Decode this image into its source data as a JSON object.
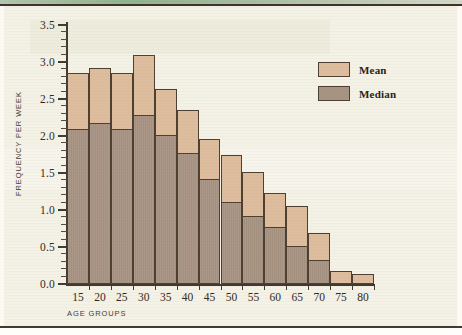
{
  "chart_data": {
    "type": "bar",
    "subtype": "overlaid-stacked",
    "title": "",
    "xlabel": "AGE GROUPS",
    "ylabel": "FREQUENCY PER WEEK",
    "categories": [
      "15",
      "20",
      "25",
      "30",
      "35",
      "40",
      "45",
      "50",
      "55",
      "60",
      "65",
      "70",
      "75",
      "80"
    ],
    "series": [
      {
        "name": "Mean",
        "color": "#ddbd9e",
        "values": [
          2.85,
          2.92,
          2.85,
          3.1,
          2.64,
          2.35,
          1.96,
          1.75,
          1.52,
          1.23,
          1.06,
          0.69,
          0.17,
          0.13
        ]
      },
      {
        "name": "Median",
        "color": "#a79382",
        "values": [
          2.1,
          2.17,
          2.1,
          2.28,
          2.01,
          1.77,
          1.42,
          1.11,
          0.92,
          0.77,
          0.52,
          0.32,
          0.0,
          0.0
        ]
      }
    ],
    "ylim": [
      0.0,
      3.5
    ],
    "ytick_labels": [
      "0.0",
      "0.5",
      "1.0",
      "1.5",
      "2.0",
      "2.5",
      "3.0",
      "3.5"
    ],
    "ytick_values": [
      0.0,
      0.5,
      1.0,
      1.5,
      2.0,
      2.5,
      3.0,
      3.5
    ],
    "y_minor_tick_step": 0.1,
    "grid": false,
    "legend_position": "upper-right",
    "legend": [
      "Mean",
      "Median"
    ]
  },
  "legend": {
    "entries": [
      {
        "label": "Mean",
        "swatch": "mean"
      },
      {
        "label": "Median",
        "swatch": "median"
      }
    ]
  },
  "axes": {
    "x_title": "AGE GROUPS",
    "y_title": "FREQUENCY PER WEEK"
  },
  "colors": {
    "mean_fill": "#ddbd9e",
    "median_fill": "#a79382",
    "outline": "#4d3f32",
    "page_background": "#f4f1e6",
    "rule": "#3a332c",
    "top_tint": "#7fa87a"
  }
}
